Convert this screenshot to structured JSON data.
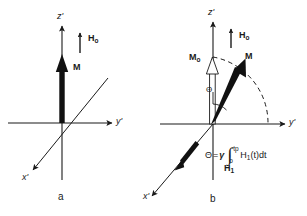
{
  "figure": {
    "background_color": "#ffffff",
    "ink_color": "#1a1a1a",
    "width": 307,
    "height": 216
  },
  "panels": [
    {
      "id": "a",
      "caption": "a",
      "axes": {
        "z": "z'",
        "y": "y'",
        "x": "x'"
      },
      "vectors": [
        {
          "name": "H0",
          "label": "H",
          "sub": "o",
          "style": "thin-solid-arrow"
        },
        {
          "name": "M",
          "label": "M",
          "sub": "",
          "style": "thick-solid-arrow"
        }
      ]
    },
    {
      "id": "b",
      "caption": "b",
      "axes": {
        "z": "z'",
        "y": "y'",
        "x": "x'"
      },
      "vectors": [
        {
          "name": "H0",
          "label": "H",
          "sub": "o",
          "style": "thin-solid-arrow"
        },
        {
          "name": "M0",
          "label": "M",
          "sub": "o",
          "style": "hollow-outline-arrow"
        },
        {
          "name": "M",
          "label": "M",
          "sub": "",
          "style": "thick-solid-arrow"
        },
        {
          "name": "H1",
          "label": "H",
          "sub": "1",
          "style": "thick-solid-arrow"
        }
      ],
      "angle": {
        "symbol": "Θ",
        "name": "theta"
      },
      "arc": {
        "style": "dashed",
        "name": "precession-arc"
      },
      "formula": {
        "lhs": "Θ",
        "equals": "=",
        "gamma": "γ",
        "upper_limit": "t",
        "upper_limit_sub": "p",
        "lower_limit": "o",
        "integrand_main": "H",
        "integrand_sub": "1",
        "integrand_rest": "(t)dt",
        "plain": "Θ = γ ∫(o to tp) H₁(t)dt"
      }
    }
  ]
}
